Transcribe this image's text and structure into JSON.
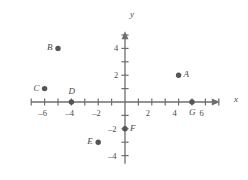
{
  "figure": {
    "type": "coordinate-plane",
    "background_color": "#ffffff",
    "ink_color": "#6e6e6e",
    "label_color": "#4a4a4a",
    "point_color": "#555555"
  },
  "axes": {
    "x_label": "x",
    "y_label": "y",
    "x_range": [
      -7,
      7
    ],
    "y_range": [
      -4.6,
      5.2
    ],
    "tick_step": 1,
    "grid": false,
    "x_tick_labels": [
      {
        "value": -6,
        "text": "–6"
      },
      {
        "value": -4,
        "text": "–4"
      },
      {
        "value": -2,
        "text": "–2"
      },
      {
        "value": 2,
        "text": "2"
      },
      {
        "value": 4,
        "text": "4"
      },
      {
        "value": 6,
        "text": "6"
      }
    ],
    "y_tick_labels": [
      {
        "value": 4,
        "text": "4"
      },
      {
        "value": 2,
        "text": "2"
      },
      {
        "value": -2,
        "text": "–2"
      },
      {
        "value": -4,
        "text": "–4"
      }
    ]
  },
  "chart_data": {
    "type": "scatter",
    "title": "",
    "xlabel": "x",
    "ylabel": "y",
    "xlim": [
      -7,
      7
    ],
    "ylim": [
      -4.6,
      5.2
    ],
    "grid": false,
    "legend": "none",
    "points": [
      {
        "label": "A",
        "x": 4,
        "y": 2,
        "label_side": "right"
      },
      {
        "label": "B",
        "x": -5,
        "y": 4,
        "label_side": "left"
      },
      {
        "label": "C",
        "x": -6,
        "y": 1,
        "label_side": "left"
      },
      {
        "label": "D",
        "x": -4,
        "y": 0,
        "label_side": "above"
      },
      {
        "label": "E",
        "x": -2,
        "y": -3,
        "label_side": "left"
      },
      {
        "label": "F",
        "x": 0,
        "y": -2,
        "label_side": "right"
      },
      {
        "label": "G",
        "x": 5,
        "y": 0,
        "label_side": "below"
      }
    ]
  }
}
